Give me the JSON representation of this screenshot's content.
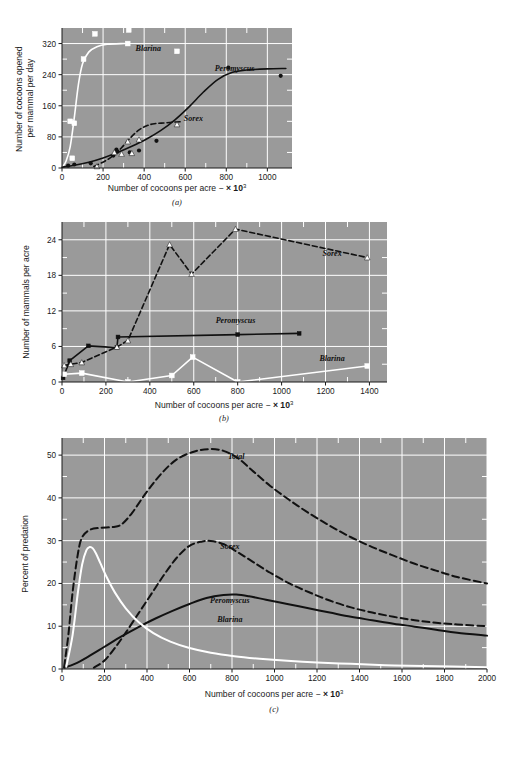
{
  "figure": {
    "background_color": "#ffffff",
    "plot_background_color": "#9a9a9a",
    "grid_color": "#ffffff",
    "axis_color": "#1a1a1a",
    "series_colors": {
      "blarina": "#ffffff",
      "peromyscus": "#111111",
      "sorex": "#111111",
      "total": "#111111"
    },
    "panel_letters": {
      "a": "(a)",
      "b": "(b)",
      "c": "(c)"
    }
  },
  "common": {
    "xlabel_prefix": "Number of cocoons per acre − ",
    "xlabel_multiplier": "× 10",
    "xlabel_exponent": "3"
  },
  "chart_data": [
    {
      "id": "a",
      "type": "scatter",
      "title": "",
      "panel_letter": "(a)",
      "xlabel": "Number of cocoons per acre − × 10³",
      "ylabel": "Number of cocoons opened per mammal per day",
      "xlim": [
        0,
        1120
      ],
      "ylim": [
        0,
        360
      ],
      "xticks": [
        0,
        200,
        400,
        600,
        800,
        1000
      ],
      "xtick_labels": [
        "0",
        "200",
        "400",
        "600",
        "800",
        "1000"
      ],
      "yticks": [
        0,
        80,
        160,
        240,
        320
      ],
      "ytick_labels": [
        "0",
        "80",
        "160",
        "240",
        "320"
      ],
      "grid": true,
      "legend_position": "inline-annotations",
      "series": [
        {
          "name": "Blarina",
          "style": "solid",
          "color": "#ffffff",
          "marker": "square-open-white",
          "label_xy": [
            420,
            300
          ],
          "curve": [
            [
              0,
              0
            ],
            [
              20,
              18
            ],
            [
              40,
              55
            ],
            [
              60,
              130
            ],
            [
              80,
              215
            ],
            [
              100,
              268
            ],
            [
              130,
              298
            ],
            [
              170,
              312
            ],
            [
              220,
              318
            ],
            [
              300,
              320
            ],
            [
              330,
              320
            ]
          ],
          "points": [
            [
              40,
              120
            ],
            [
              50,
              25
            ],
            [
              60,
              115
            ],
            [
              105,
              280
            ],
            [
              160,
              345
            ],
            [
              320,
              320
            ],
            [
              325,
              355
            ],
            [
              560,
              300
            ]
          ]
        },
        {
          "name": "Peromyscus",
          "style": "solid",
          "color": "#111111",
          "marker": "circle-filled-black",
          "label_xy": [
            840,
            250
          ],
          "curve": [
            [
              0,
              2
            ],
            [
              60,
              7
            ],
            [
              130,
              15
            ],
            [
              200,
              26
            ],
            [
              270,
              40
            ],
            [
              340,
              56
            ],
            [
              410,
              74
            ],
            [
              480,
              96
            ],
            [
              550,
              124
            ],
            [
              620,
              158
            ],
            [
              690,
              196
            ],
            [
              760,
              228
            ],
            [
              830,
              246
            ],
            [
              900,
              252
            ],
            [
              1000,
              255
            ],
            [
              1090,
              256
            ]
          ],
          "points": [
            [
              30,
              6
            ],
            [
              60,
              9
            ],
            [
              140,
              12
            ],
            [
              250,
              32
            ],
            [
              265,
              47
            ],
            [
              270,
              42
            ],
            [
              330,
              40
            ],
            [
              375,
              45
            ],
            [
              460,
              70
            ],
            [
              810,
              258
            ],
            [
              1065,
              237
            ]
          ]
        },
        {
          "name": "Sorex",
          "style": "dashed",
          "color": "#111111",
          "marker": "triangle-filled-white",
          "label_xy": [
            640,
            122
          ],
          "curve": [
            [
              155,
              4
            ],
            [
              210,
              18
            ],
            [
              250,
              32
            ],
            [
              290,
              52
            ],
            [
              330,
              76
            ],
            [
              370,
              96
            ],
            [
              410,
              108
            ],
            [
              450,
              114
            ],
            [
              500,
              116
            ],
            [
              545,
              118
            ],
            [
              580,
              119
            ]
          ],
          "points": [
            [
              170,
              4
            ],
            [
              255,
              40
            ],
            [
              290,
              36
            ],
            [
              320,
              68
            ],
            [
              340,
              38
            ],
            [
              375,
              73
            ],
            [
              560,
              112
            ]
          ]
        }
      ]
    },
    {
      "id": "b",
      "type": "line",
      "title": "",
      "panel_letter": "(b)",
      "xlabel": "Number of cocoons per acre − × 10³",
      "ylabel": "Number of mammals per acre",
      "xlim": [
        0,
        1480
      ],
      "ylim": [
        0,
        27
      ],
      "xticks": [
        0,
        200,
        400,
        600,
        800,
        1000,
        1200,
        1400
      ],
      "xtick_labels": [
        "0",
        "200",
        "400",
        "600",
        "800",
        "1000",
        "1200",
        "1400"
      ],
      "yticks": [
        0,
        6,
        12,
        18,
        24
      ],
      "ytick_labels": [
        "0",
        "6",
        "12",
        "18",
        "24"
      ],
      "grid": true,
      "legend_position": "inline-annotations",
      "series": [
        {
          "name": "Peromyscus",
          "style": "solid",
          "color": "#111111",
          "marker": "square-filled-black",
          "label_xy": [
            790,
            10.0
          ],
          "points": [
            [
              5,
              0.7
            ],
            [
              35,
              3.6
            ],
            [
              120,
              6.1
            ],
            [
              250,
              5.8
            ],
            [
              255,
              7.6
            ],
            [
              800,
              8.0
            ],
            [
              1080,
              8.2
            ]
          ]
        },
        {
          "name": "Sorex",
          "style": "dashed",
          "color": "#111111",
          "marker": "triangle-filled-white",
          "label_xy": [
            1230,
            21.2
          ],
          "points": [
            [
              10,
              2.8
            ],
            [
              40,
              3.0
            ],
            [
              90,
              3.3
            ],
            [
              250,
              5.9
            ],
            [
              300,
              7.0
            ],
            [
              490,
              23.2
            ],
            [
              590,
              18.2
            ],
            [
              790,
              25.8
            ],
            [
              1390,
              21.0
            ]
          ]
        },
        {
          "name": "Blarina",
          "style": "solid",
          "color": "#ffffff",
          "marker": "square-open-white",
          "label_xy": [
            1230,
            3.6
          ],
          "points": [
            [
              10,
              1.3
            ],
            [
              90,
              1.5
            ],
            [
              300,
              0.0
            ],
            [
              500,
              1.1
            ],
            [
              595,
              4.2
            ],
            [
              800,
              0.0
            ],
            [
              1390,
              2.7
            ]
          ]
        }
      ]
    },
    {
      "id": "c",
      "type": "line",
      "title": "",
      "panel_letter": "(c)",
      "xlabel": "Number of cocoons per acre − × 10³",
      "ylabel": "Percent of predation",
      "xlim": [
        0,
        2000
      ],
      "ylim": [
        0,
        54
      ],
      "xticks": [
        0,
        200,
        400,
        600,
        800,
        1000,
        1200,
        1400,
        1600,
        1800,
        2000
      ],
      "xtick_labels": [
        "0",
        "200",
        "400",
        "600",
        "800",
        "1000",
        "1200",
        "1400",
        "1600",
        "1800",
        "2000"
      ],
      "yticks": [
        0,
        10,
        20,
        30,
        40,
        50
      ],
      "ytick_labels": [
        "0",
        "10",
        "20",
        "30",
        "40",
        "50"
      ],
      "grid": true,
      "legend_position": "inline-annotations",
      "series": [
        {
          "name": "Total",
          "style": "dashed",
          "color": "#111111",
          "label_xy": [
            820,
            49.0
          ],
          "curve": [
            [
              10,
              0.5
            ],
            [
              30,
              8
            ],
            [
              50,
              18
            ],
            [
              75,
              27
            ],
            [
              95,
              30.8
            ],
            [
              130,
              32.5
            ],
            [
              180,
              33.0
            ],
            [
              240,
              33.2
            ],
            [
              280,
              33.8
            ],
            [
              330,
              36.5
            ],
            [
              400,
              41.5
            ],
            [
              470,
              45.8
            ],
            [
              540,
              49.0
            ],
            [
              620,
              50.8
            ],
            [
              690,
              51.4
            ],
            [
              760,
              51.0
            ],
            [
              830,
              49.2
            ],
            [
              900,
              46.2
            ],
            [
              980,
              42.8
            ],
            [
              1070,
              39.5
            ],
            [
              1160,
              36.5
            ],
            [
              1260,
              33.5
            ],
            [
              1360,
              30.8
            ],
            [
              1460,
              28.5
            ],
            [
              1560,
              26.5
            ],
            [
              1660,
              24.6
            ],
            [
              1760,
              23.0
            ],
            [
              1860,
              21.5
            ],
            [
              2000,
              20.0
            ]
          ]
        },
        {
          "name": "Sorex",
          "style": "dashed",
          "color": "#111111",
          "label_xy": [
            790,
            28.0
          ],
          "curve": [
            [
              150,
              0.3
            ],
            [
              200,
              2.0
            ],
            [
              250,
              5.0
            ],
            [
              300,
              8.5
            ],
            [
              360,
              13.0
            ],
            [
              420,
              17.5
            ],
            [
              480,
              22.0
            ],
            [
              540,
              26.0
            ],
            [
              600,
              28.8
            ],
            [
              660,
              29.8
            ],
            [
              700,
              29.9
            ],
            [
              760,
              29.2
            ],
            [
              830,
              27.2
            ],
            [
              900,
              25.0
            ],
            [
              980,
              22.5
            ],
            [
              1070,
              20.0
            ],
            [
              1160,
              18.0
            ],
            [
              1260,
              16.0
            ],
            [
              1360,
              14.4
            ],
            [
              1460,
              13.2
            ],
            [
              1560,
              12.2
            ],
            [
              1660,
              11.4
            ],
            [
              1760,
              10.8
            ],
            [
              1860,
              10.4
            ],
            [
              2000,
              10.0
            ]
          ]
        },
        {
          "name": "Peromyscus",
          "style": "solid",
          "color": "#111111",
          "label_xy": [
            790,
            15.4
          ],
          "curve": [
            [
              10,
              0.3
            ],
            [
              60,
              1.2
            ],
            [
              120,
              2.8
            ],
            [
              200,
              5.2
            ],
            [
              280,
              7.6
            ],
            [
              360,
              9.8
            ],
            [
              440,
              11.8
            ],
            [
              520,
              13.6
            ],
            [
              600,
              15.2
            ],
            [
              680,
              16.6
            ],
            [
              760,
              17.3
            ],
            [
              820,
              17.4
            ],
            [
              880,
              17.0
            ],
            [
              960,
              16.2
            ],
            [
              1060,
              15.2
            ],
            [
              1160,
              14.2
            ],
            [
              1260,
              13.2
            ],
            [
              1360,
              12.2
            ],
            [
              1460,
              11.4
            ],
            [
              1560,
              10.6
            ],
            [
              1660,
              9.9
            ],
            [
              1760,
              9.2
            ],
            [
              1860,
              8.5
            ],
            [
              2000,
              7.8
            ]
          ]
        },
        {
          "name": "Blarina",
          "style": "solid",
          "color": "#ffffff",
          "label_xy": [
            790,
            11.0
          ],
          "curve": [
            [
              20,
              0.5
            ],
            [
              50,
              8
            ],
            [
              75,
              18
            ],
            [
              95,
              24.5
            ],
            [
              115,
              27.8
            ],
            [
              130,
              28.5
            ],
            [
              145,
              28.2
            ],
            [
              160,
              27.0
            ],
            [
              180,
              24.8
            ],
            [
              210,
              21.5
            ],
            [
              250,
              17.8
            ],
            [
              300,
              14.2
            ],
            [
              360,
              11.0
            ],
            [
              430,
              8.4
            ],
            [
              510,
              6.4
            ],
            [
              600,
              4.9
            ],
            [
              700,
              3.8
            ],
            [
              810,
              3.0
            ],
            [
              930,
              2.4
            ],
            [
              1060,
              1.9
            ],
            [
              1200,
              1.5
            ],
            [
              1360,
              1.2
            ],
            [
              1520,
              0.9
            ],
            [
              1700,
              0.7
            ],
            [
              2000,
              0.4
            ]
          ]
        }
      ]
    }
  ]
}
